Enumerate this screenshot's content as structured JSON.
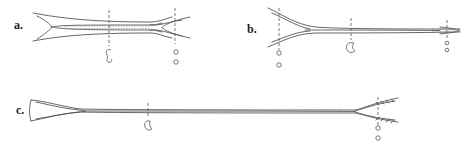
{
  "figure": {
    "panels": [
      {
        "id": "a",
        "label": "a.",
        "label_pos": [
          14,
          28
        ]
      },
      {
        "id": "b",
        "label": "b.",
        "label_pos": [
          247,
          34
        ]
      },
      {
        "id": "c",
        "label": "c.",
        "label_pos": [
          16,
          113
        ]
      }
    ],
    "colors": {
      "line": "#555555",
      "background": "#ffffff",
      "label": "#222222"
    }
  }
}
